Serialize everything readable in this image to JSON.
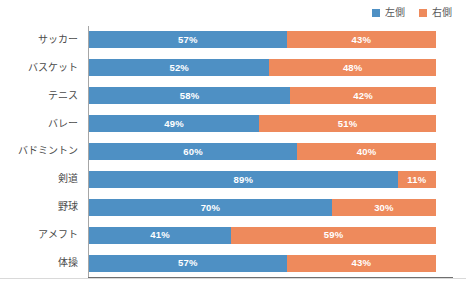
{
  "legend": {
    "position": "top-right",
    "entries": [
      {
        "label": "左側",
        "color": "#4e90c4",
        "icon": "square-swatch-icon"
      },
      {
        "label": "右側",
        "color": "#ee8a5c",
        "icon": "square-swatch-icon"
      }
    ]
  },
  "colors": {
    "left": "#4e90c4",
    "right": "#ee8a5c",
    "axis": "#a6a6a6",
    "axis_bottom": "#6f6f6f",
    "label_text": "#4a4a4a",
    "value_text": "#ffffff",
    "background": "#ffffff"
  },
  "chart_data": {
    "type": "bar",
    "orientation": "horizontal",
    "stacked": true,
    "stack_total": 100,
    "unit": "%",
    "title": "",
    "subtitle": "",
    "xlabel": "",
    "ylabel": "",
    "xlim": [
      0,
      100
    ],
    "grid": false,
    "legend_position": "top-right",
    "categories": [
      "サッカー",
      "バスケット",
      "テニス",
      "バレー",
      "バドミントン",
      "剣道",
      "野球",
      "アメフト",
      "体操"
    ],
    "series": [
      {
        "name": "左側",
        "color": "#4e90c4",
        "values": [
          57,
          52,
          58,
          49,
          60,
          89,
          70,
          41,
          57
        ],
        "labels": [
          "57%",
          "52%",
          "58%",
          "49%",
          "60%",
          "89%",
          "70%",
          "41%",
          "57%"
        ]
      },
      {
        "name": "右側",
        "color": "#ee8a5c",
        "values": [
          43,
          48,
          42,
          51,
          40,
          11,
          30,
          59,
          43
        ],
        "labels": [
          "43%",
          "48%",
          "42%",
          "51%",
          "40%",
          "11%",
          "30%",
          "59%",
          "43%"
        ]
      }
    ],
    "rows": [
      {
        "category": "サッカー",
        "left": 57,
        "right": 43,
        "left_label": "57%",
        "right_label": "43%"
      },
      {
        "category": "バスケット",
        "left": 52,
        "right": 48,
        "left_label": "52%",
        "right_label": "48%"
      },
      {
        "category": "テニス",
        "left": 58,
        "right": 42,
        "left_label": "58%",
        "right_label": "42%"
      },
      {
        "category": "バレー",
        "left": 49,
        "right": 51,
        "left_label": "49%",
        "right_label": "51%"
      },
      {
        "category": "バドミントン",
        "left": 60,
        "right": 40,
        "left_label": "60%",
        "right_label": "40%"
      },
      {
        "category": "剣道",
        "left": 89,
        "right": 11,
        "left_label": "89%",
        "right_label": "11%"
      },
      {
        "category": "野球",
        "left": 70,
        "right": 30,
        "left_label": "70%",
        "right_label": "30%"
      },
      {
        "category": "アメフト",
        "left": 41,
        "right": 59,
        "left_label": "41%",
        "right_label": "59%"
      },
      {
        "category": "体操",
        "left": 57,
        "right": 43,
        "left_label": "57%",
        "right_label": "43%"
      }
    ]
  }
}
